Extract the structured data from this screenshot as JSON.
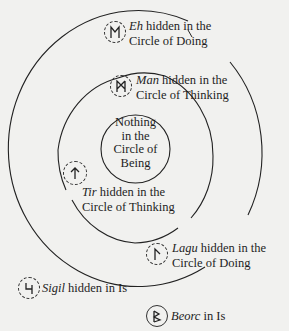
{
  "diagram": {
    "circles": [
      {
        "id": "outer",
        "name": "Circle of Doing"
      },
      {
        "id": "middle",
        "name": "Circle of Thinking"
      },
      {
        "id": "inner",
        "name": "Circle of Being"
      }
    ],
    "center_text": [
      "Nothing",
      "in the",
      "Circle of",
      "Being"
    ],
    "labels": [
      {
        "rune": "Eh",
        "icon": "eh-rune-icon",
        "line1_rest": " hidden in the",
        "line2": "Circle of Doing",
        "border": "dashed"
      },
      {
        "rune": "Man",
        "icon": "man-rune-icon",
        "line1_rest": " hidden in the",
        "line2": "Circle of Thinking",
        "border": "dashed"
      },
      {
        "rune": "Tir",
        "icon": "tir-rune-icon",
        "line1_rest": " hidden in the",
        "line2": "Circle of Thinking",
        "border": "dashed"
      },
      {
        "rune": "Lagu",
        "icon": "lagu-rune-icon",
        "line1_rest": " hidden in the",
        "line2": "Circle of Doing",
        "border": "dashed"
      },
      {
        "rune": "Sigil",
        "icon": "sigil-rune-icon",
        "line1_rest": " hidden in Is",
        "border": "dashed"
      },
      {
        "rune": "Beorc",
        "icon": "beorc-rune-icon",
        "line1_rest": " in Is",
        "border": "solid"
      }
    ],
    "colors": {
      "background": "#f1f1ef",
      "ink": "#1e1e1e"
    }
  }
}
